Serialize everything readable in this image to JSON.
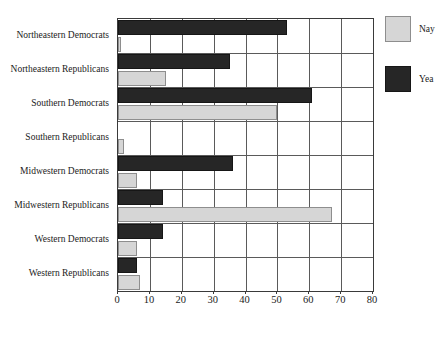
{
  "chart_data": {
    "type": "bar",
    "orientation": "horizontal",
    "title": "",
    "xlabel": "",
    "ylabel": "",
    "xlim": [
      0,
      80
    ],
    "xticks": [
      0,
      10,
      20,
      30,
      40,
      50,
      60,
      70,
      80
    ],
    "grid": true,
    "legend_position": "right",
    "categories": [
      "Northeastern Democrats",
      "Northeastern Republicans",
      "Southern Democrats",
      "Southern Republicans",
      "Midwestern Democrats",
      "Midwestern Republicans",
      "Western Democrats",
      "Western Republicans"
    ],
    "series": [
      {
        "name": "Yea",
        "color": "#262626",
        "values": [
          53,
          35,
          61,
          0,
          36,
          14,
          14,
          6
        ]
      },
      {
        "name": "Nay",
        "color": "#d6d6d6",
        "values": [
          1,
          15,
          50,
          2,
          6,
          67,
          6,
          7
        ]
      }
    ]
  },
  "legend": {
    "items": [
      {
        "label": "Nay",
        "swatch": "nay"
      },
      {
        "label": "Yea",
        "swatch": "yea"
      }
    ]
  }
}
